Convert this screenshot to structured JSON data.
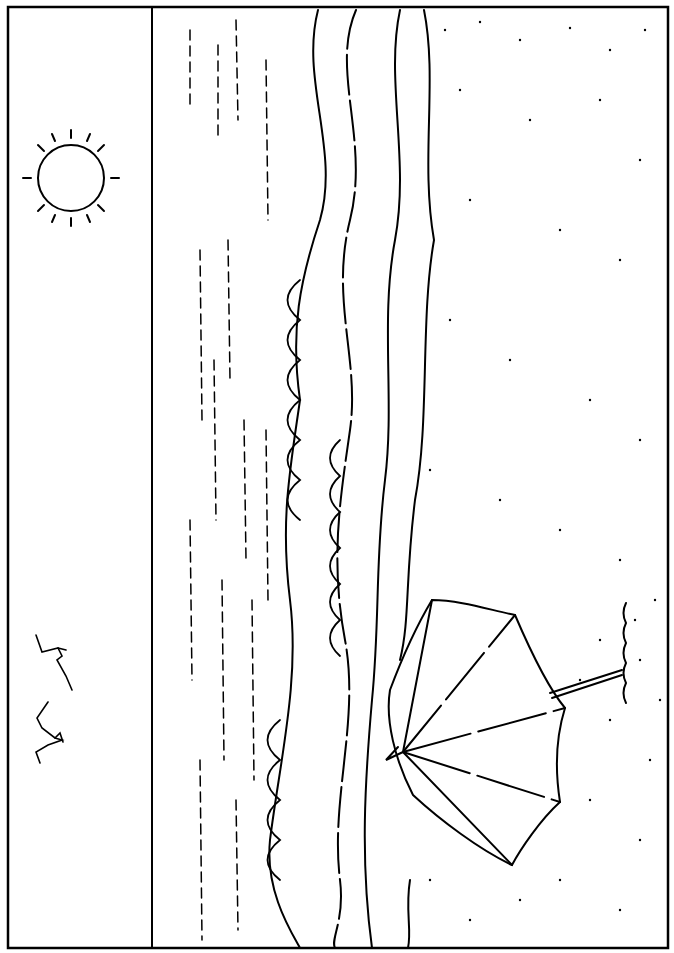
{
  "scene": {
    "type": "line-art coloring page",
    "subject": "beach scene (rotated 90°)",
    "elements": [
      "sky",
      "sun",
      "seagulls",
      "sea waves",
      "sand",
      "beach umbrella"
    ],
    "colors": {
      "line": "#000000",
      "background": "#ffffff"
    }
  }
}
